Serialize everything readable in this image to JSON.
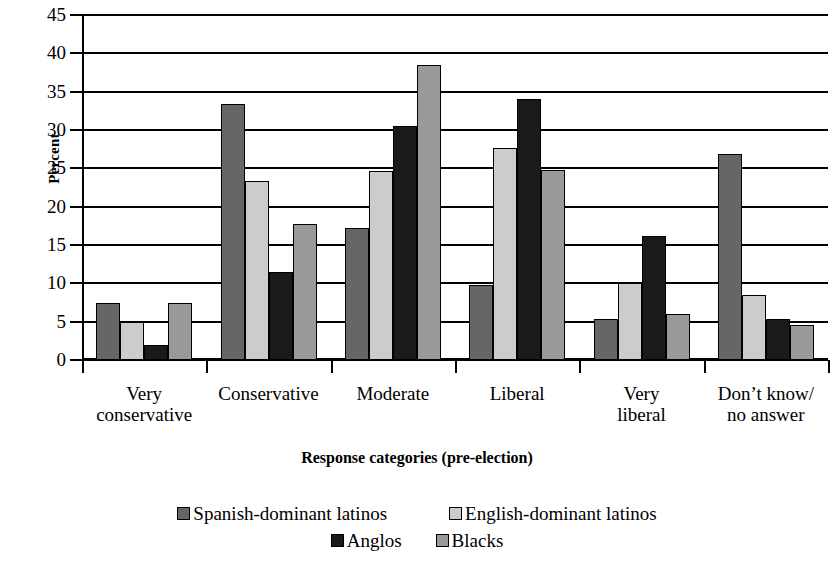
{
  "chart_data": {
    "type": "bar",
    "title": "",
    "xlabel": "Response categories (pre-election)",
    "ylabel": "Percent",
    "ylim": [
      0,
      45
    ],
    "ytick_step": 5,
    "yticks": [
      45,
      40,
      35,
      30,
      25,
      20,
      15,
      10,
      5,
      0
    ],
    "grid": "horizontal",
    "legend_position": "bottom",
    "categories": [
      "Very\nconservative",
      "Conservative",
      "Moderate",
      "Liberal",
      "Very\nliberal",
      "Don’t know/\nno answer"
    ],
    "category_lines": [
      [
        "Very",
        "conservative"
      ],
      [
        "Conservative",
        ""
      ],
      [
        "Moderate",
        ""
      ],
      [
        "Liberal",
        ""
      ],
      [
        "Very",
        "liberal"
      ],
      [
        "Don’t know/",
        "no answer"
      ]
    ],
    "series": [
      {
        "name": "Spanish-dominant latinos",
        "color": "#666666",
        "values": [
          7.5,
          33.4,
          17.2,
          9.8,
          5.3,
          26.9
        ]
      },
      {
        "name": "English-dominant latinos",
        "color": "#cccccc",
        "values": [
          5.0,
          23.3,
          24.7,
          27.6,
          10.1,
          8.5
        ]
      },
      {
        "name": "Anglos",
        "color": "#1a1a1a",
        "values": [
          2.0,
          11.5,
          30.5,
          34.1,
          16.2,
          5.3
        ]
      },
      {
        "name": "Blacks",
        "color": "#999999",
        "values": [
          7.5,
          17.7,
          38.5,
          24.8,
          6.0,
          4.6
        ]
      }
    ]
  },
  "legend": {
    "rows": [
      [
        "Spanish-dominant latinos",
        "English-dominant latinos"
      ],
      [
        "Anglos",
        "Blacks"
      ]
    ]
  }
}
